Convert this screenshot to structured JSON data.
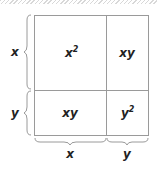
{
  "diagram": {
    "cells": [
      {
        "id": "top-left",
        "base": "x",
        "sup": "2"
      },
      {
        "id": "top-right",
        "base": "xy",
        "sup": ""
      },
      {
        "id": "bottom-left",
        "base": "xy",
        "sup": ""
      },
      {
        "id": "bottom-right",
        "base": "y",
        "sup": "2"
      }
    ],
    "left_labels": [
      "x",
      "y"
    ],
    "bottom_labels": [
      "x",
      "y"
    ],
    "colors": {
      "line": "#9a9a9a",
      "text": "#222222",
      "background": "#ffffff"
    }
  }
}
